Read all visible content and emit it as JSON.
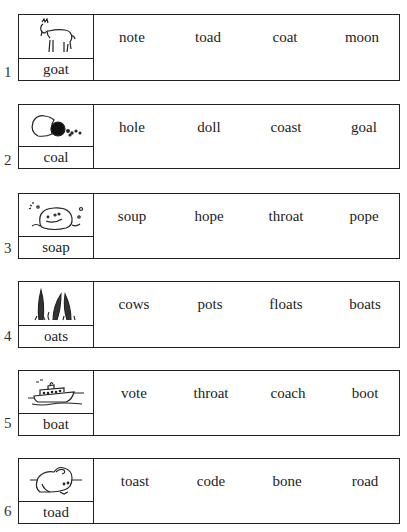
{
  "worksheet": {
    "rows": [
      {
        "number": "1",
        "picture": "goat-picture",
        "label": "goat",
        "options": [
          "note",
          "toad",
          "coat",
          "moon"
        ]
      },
      {
        "number": "2",
        "picture": "coal-picture",
        "label": "coal",
        "options": [
          "hole",
          "doll",
          "coast",
          "goal"
        ]
      },
      {
        "number": "3",
        "picture": "soap-picture",
        "label": "soap",
        "options": [
          "soup",
          "hope",
          "throat",
          "pope"
        ]
      },
      {
        "number": "4",
        "picture": "oats-picture",
        "label": "oats",
        "options": [
          "cows",
          "pots",
          "floats",
          "boats"
        ]
      },
      {
        "number": "5",
        "picture": "boat-picture",
        "label": "boat",
        "options": [
          "vote",
          "throat",
          "coach",
          "boot"
        ]
      },
      {
        "number": "6",
        "picture": "toad-picture",
        "label": "toad",
        "options": [
          "toast",
          "code",
          "bone",
          "road"
        ]
      }
    ]
  }
}
